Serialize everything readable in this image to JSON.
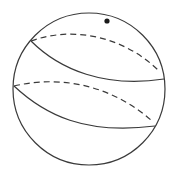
{
  "diagram": {
    "type": "sphere-with-bands",
    "colors": {
      "background": "#ffffff",
      "stroke": "#3a3a3a",
      "dot": "#1a1a1a"
    },
    "sphere": {
      "cx": 89,
      "cy": 89,
      "r": 76
    },
    "point": {
      "cx": 107,
      "cy": 21,
      "r": 2.6
    },
    "curves": [
      {
        "id": "upper-front",
        "style": "solid",
        "d": "M31,41 C60,70 105,88 164,79"
      },
      {
        "id": "upper-back",
        "style": "dashed",
        "d": "M31,41 C75,25 125,38 158,70"
      },
      {
        "id": "lower-front",
        "style": "solid",
        "d": "M14,86 C45,115 85,135 155,126"
      },
      {
        "id": "lower-back",
        "style": "dashed",
        "d": "M14,86 C65,74 115,88 152,121"
      }
    ]
  }
}
